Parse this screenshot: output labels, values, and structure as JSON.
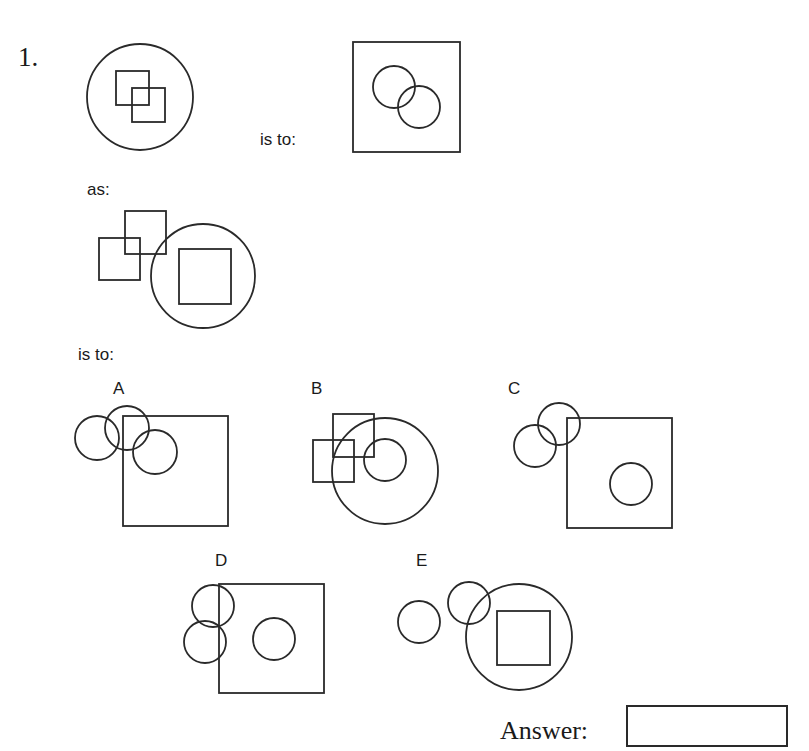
{
  "question": {
    "number": "1.",
    "connector_is_to_1": "is to:",
    "connector_as": "as:",
    "connector_is_to_2": "is to:",
    "stem_figures": [
      {
        "id": "figure-1",
        "description": "large circle containing two overlapping squares"
      },
      {
        "id": "figure-2",
        "description": "large square containing two overlapping circles"
      },
      {
        "id": "figure-3",
        "description": "two overlapping squares outside-left of a large circle containing a square"
      }
    ],
    "options": [
      {
        "letter": "A",
        "description": "three overlapping circles partially overlapping a large square"
      },
      {
        "letter": "B",
        "description": "two overlapping squares overlapping a large circle containing a small circle"
      },
      {
        "letter": "C",
        "description": "two overlapping circles outside-left of a large square containing a circle"
      },
      {
        "letter": "D",
        "description": "two overlapping circles touching edge of a large square containing a circle"
      },
      {
        "letter": "E",
        "description": "two overlapping circles outside-left of a large circle containing a square"
      }
    ]
  },
  "answer": {
    "label": "Answer:",
    "value": ""
  }
}
